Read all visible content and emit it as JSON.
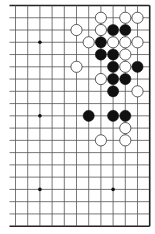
{
  "board": {
    "columns": 12,
    "rows": 19,
    "origin_x": 15.5,
    "origin_y": 5.5,
    "spacing_x": 12.2,
    "spacing_y": 12.26,
    "left_open_extension": 6,
    "edges": {
      "top": true,
      "bottom": true,
      "right": true,
      "left": false
    },
    "line_color": "#555555",
    "edge_color": "#222222",
    "star_points": [
      [
        2,
        3
      ],
      [
        2,
        9
      ],
      [
        2,
        15
      ],
      [
        8,
        15
      ]
    ],
    "stones": [
      {
        "c": 7,
        "r": 1,
        "color": "white"
      },
      {
        "c": 9,
        "r": 1,
        "color": "white"
      },
      {
        "c": 10,
        "r": 1,
        "color": "white"
      },
      {
        "c": 5,
        "r": 2,
        "color": "white"
      },
      {
        "c": 7,
        "r": 2,
        "color": "white"
      },
      {
        "c": 8,
        "r": 2,
        "color": "black"
      },
      {
        "c": 9,
        "r": 2,
        "color": "black"
      },
      {
        "c": 6,
        "r": 3,
        "color": "white"
      },
      {
        "c": 7,
        "r": 3,
        "color": "black"
      },
      {
        "c": 8,
        "r": 3,
        "color": "white"
      },
      {
        "c": 9,
        "r": 3,
        "color": "white"
      },
      {
        "c": 10,
        "r": 3,
        "color": "white"
      },
      {
        "c": 7,
        "r": 4,
        "color": "black"
      },
      {
        "c": 8,
        "r": 4,
        "color": "black"
      },
      {
        "c": 9,
        "r": 4,
        "color": "white"
      },
      {
        "c": 5,
        "r": 5,
        "color": "white"
      },
      {
        "c": 8,
        "r": 5,
        "color": "black"
      },
      {
        "c": 9,
        "r": 5,
        "color": "white"
      },
      {
        "c": 10,
        "r": 5,
        "color": "black"
      },
      {
        "c": 7,
        "r": 6,
        "color": "white"
      },
      {
        "c": 8,
        "r": 6,
        "color": "black"
      },
      {
        "c": 9,
        "r": 6,
        "color": "black"
      },
      {
        "c": 8,
        "r": 7,
        "color": "black"
      },
      {
        "c": 10,
        "r": 7,
        "color": "white"
      },
      {
        "c": 6,
        "r": 9,
        "color": "black"
      },
      {
        "c": 8,
        "r": 9,
        "color": "black"
      },
      {
        "c": 9,
        "r": 9,
        "color": "black"
      },
      {
        "c": 9,
        "r": 10,
        "color": "white"
      },
      {
        "c": 7,
        "r": 11,
        "color": "white"
      },
      {
        "c": 9,
        "r": 11,
        "color": "white"
      }
    ]
  }
}
